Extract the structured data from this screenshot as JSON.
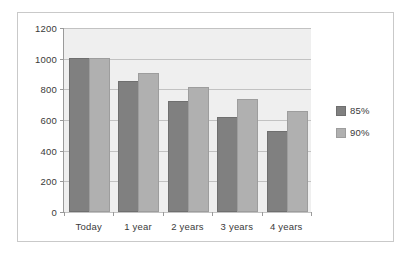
{
  "chart_data": {
    "type": "bar",
    "title": "",
    "xlabel": "",
    "ylabel": "",
    "categories": [
      "Today",
      "1 year",
      "2 years",
      "3 years",
      "4 years"
    ],
    "series": [
      {
        "name": "85%",
        "color": "#808080",
        "values": [
          1000,
          850,
          720,
          615,
          520
        ]
      },
      {
        "name": "90%",
        "color": "#b0b0b0",
        "values": [
          1000,
          900,
          810,
          730,
          655
        ]
      }
    ],
    "ylim": [
      0,
      1200
    ],
    "yticks": [
      0,
      200,
      400,
      600,
      800,
      1000,
      1200
    ],
    "ytick_labels": [
      "0",
      "200",
      "400",
      "600",
      "800",
      "1000",
      "1200"
    ],
    "grid": true,
    "legend_position": "right",
    "plot_background": "#efefef",
    "frame_border_color": "#c9c9c9",
    "axis_color": "#9a9a9a",
    "gridline_color": "#c2c2c2"
  }
}
